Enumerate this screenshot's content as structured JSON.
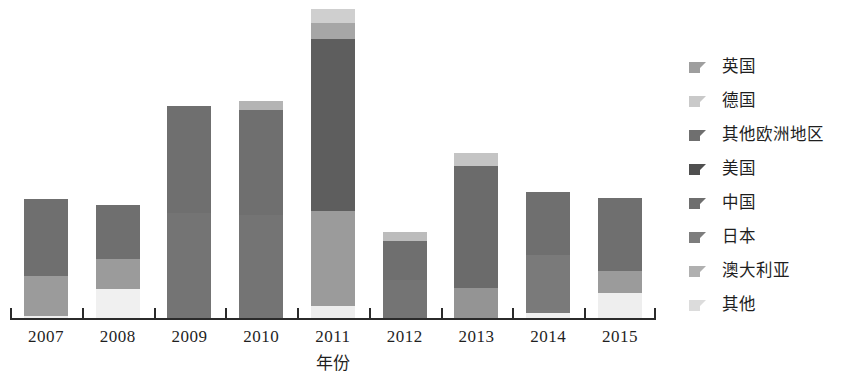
{
  "chart_data": {
    "type": "bar",
    "subtype": "stacked-column",
    "title": "",
    "xlabel": "年份",
    "ylabel": "",
    "grid": false,
    "legend_position": "right",
    "categories": [
      "2007",
      "2008",
      "2009",
      "2010",
      "2011",
      "2012",
      "2013",
      "2014",
      "2015"
    ],
    "ylim": [
      0,
      100
    ],
    "stack_order_bottom_to_top": [
      "其他",
      "澳大利亚",
      "日本",
      "中国",
      "美国",
      "其他欧洲地区",
      "德国",
      "英国"
    ],
    "series": [
      {
        "name": "英国",
        "color": "#9e9e9e",
        "values": [
          0,
          0,
          0,
          4,
          4,
          5,
          5,
          0,
          0
        ]
      },
      {
        "name": "德国",
        "color": "#c9c9c9",
        "values": [
          0,
          0,
          0,
          0,
          5,
          0,
          0,
          0,
          0
        ]
      },
      {
        "name": "其他欧洲地区",
        "color": "#8a8a8a",
        "values": [
          0,
          0,
          0,
          0,
          0,
          0,
          0,
          0,
          0
        ]
      },
      {
        "name": "美国",
        "color": "#6b6b6b",
        "values": [
          0,
          0,
          0,
          0,
          0,
          0,
          0,
          0,
          0
        ]
      },
      {
        "name": "中国",
        "color": "#7a7a7a",
        "values": [
          24,
          19,
          33,
          31,
          55,
          12,
          29,
          25,
          22
        ]
      },
      {
        "name": "日本",
        "color": "#8f8f8f",
        "values": [
          13,
          10,
          34,
          34,
          30,
          15,
          10,
          18,
          12
        ]
      },
      {
        "name": "澳大利亚",
        "color": "#bdbdbd",
        "values": [
          0,
          0,
          0,
          0,
          0,
          0,
          0,
          0,
          0
        ]
      },
      {
        "name": "其他",
        "color": "#e3e3e3",
        "values": [
          1,
          9,
          0,
          0,
          4,
          0,
          0,
          2,
          8
        ]
      }
    ],
    "bar_totals": [
      38,
      38,
      67,
      69,
      98,
      32,
      44,
      45,
      42
    ],
    "legend_entries": [
      {
        "label": "英国",
        "color": "#9e9e9e"
      },
      {
        "label": "德国",
        "color": "#c9c9c9"
      },
      {
        "label": "其他欧洲地区",
        "color": "#6f6f6f"
      },
      {
        "label": "美国",
        "color": "#4f4f4f"
      },
      {
        "label": "中国",
        "color": "#6e6e6e"
      },
      {
        "label": "日本",
        "color": "#7d7d7d"
      },
      {
        "label": "澳大利亚",
        "color": "#b0b0b0"
      },
      {
        "label": "其他",
        "color": "#dcdcdc"
      }
    ],
    "bars": [
      {
        "year": "2007",
        "segments": [
          {
            "series": "其他",
            "color": "#efefef",
            "height_px": 3
          },
          {
            "series": "日本",
            "color": "#9b9b9b",
            "height_px": 40
          },
          {
            "series": "中国",
            "color": "#6f6f6f",
            "height_px": 77
          }
        ]
      },
      {
        "year": "2008",
        "segments": [
          {
            "series": "其他",
            "color": "#f0f0f0",
            "height_px": 30
          },
          {
            "series": "日本",
            "color": "#9b9b9b",
            "height_px": 30
          },
          {
            "series": "中国",
            "color": "#6f6f6f",
            "height_px": 54
          }
        ]
      },
      {
        "year": "2009",
        "segments": [
          {
            "series": "日本",
            "color": "#747474",
            "height_px": 106
          },
          {
            "series": "中国",
            "color": "#6f6f6f",
            "height_px": 107
          }
        ]
      },
      {
        "year": "2010",
        "segments": [
          {
            "series": "日本",
            "color": "#747474",
            "height_px": 104
          },
          {
            "series": "中国",
            "color": "#6f6f6f",
            "height_px": 105
          },
          {
            "series": "英国",
            "color": "#b4b4b4",
            "height_px": 9
          }
        ]
      },
      {
        "year": "2011",
        "segments": [
          {
            "series": "其他",
            "color": "#ededed",
            "height_px": 13
          },
          {
            "series": "日本",
            "color": "#9b9b9b",
            "height_px": 95
          },
          {
            "series": "中国",
            "color": "#5e5e5e",
            "height_px": 172
          },
          {
            "series": "德国",
            "color": "#a6a6a6",
            "height_px": 16
          },
          {
            "series": "英国",
            "color": "#cfcfcf",
            "height_px": 14
          }
        ]
      },
      {
        "year": "2012",
        "segments": [
          {
            "series": "日本",
            "color": "#747474",
            "height_px": 39
          },
          {
            "series": "中国",
            "color": "#6f6f6f",
            "height_px": 39
          },
          {
            "series": "英国",
            "color": "#bcbcbc",
            "height_px": 9
          }
        ]
      },
      {
        "year": "2013",
        "segments": [
          {
            "series": "日本",
            "color": "#949494",
            "height_px": 31
          },
          {
            "series": "中国",
            "color": "#6b6b6b",
            "height_px": 122
          },
          {
            "series": "英国",
            "color": "#c4c4c4",
            "height_px": 13
          }
        ]
      },
      {
        "year": "2014",
        "segments": [
          {
            "series": "其他",
            "color": "#efefef",
            "height_px": 6
          },
          {
            "series": "日本",
            "color": "#7a7a7a",
            "height_px": 58
          },
          {
            "series": "中国",
            "color": "#6f6f6f",
            "height_px": 63
          }
        ]
      },
      {
        "year": "2015",
        "segments": [
          {
            "series": "其他",
            "color": "#eeeeee",
            "height_px": 26
          },
          {
            "series": "日本",
            "color": "#9b9b9b",
            "height_px": 22
          },
          {
            "series": "中国",
            "color": "#6f6f6f",
            "height_px": 73
          }
        ]
      }
    ]
  }
}
